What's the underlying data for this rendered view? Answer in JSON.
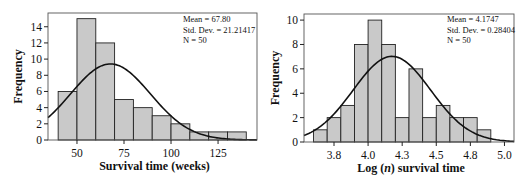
{
  "chart_data": [
    {
      "type": "bar",
      "subtype": "histogram_with_normal_curve",
      "xlabel": "Survival time (weeks)",
      "ylabel": "Frequency",
      "bin_edges": [
        40,
        50,
        60,
        70,
        80,
        90,
        100,
        110,
        120,
        130,
        140
      ],
      "values": [
        6,
        15,
        12,
        5,
        4,
        3,
        2,
        1,
        1,
        1
      ],
      "x_ticks": [
        50,
        75,
        100,
        125
      ],
      "x_tick_labels": [
        "50",
        "75",
        "100",
        "125"
      ],
      "y_ticks": [
        0,
        2,
        4,
        6,
        8,
        10,
        12,
        14
      ],
      "y_tick_labels": [
        "0",
        "2",
        "4",
        "6",
        "8",
        "10",
        "12",
        "14"
      ],
      "xlim": [
        34.6,
        145.7
      ],
      "ylim": [
        0,
        15.7
      ],
      "stats": {
        "mean_label": "Mean = 67.80",
        "sd_label": "Std. Dev. = 21.21417",
        "n_label": "N = 50"
      },
      "normal_curve": {
        "mean": 67.8,
        "sd": 21.21417,
        "n": 50,
        "bin_width": 10
      },
      "grid": false,
      "legend": "none"
    },
    {
      "type": "bar",
      "subtype": "histogram_with_normal_curve",
      "xlabel": "Log (n) survival time",
      "xlabel_parts": [
        "Log (",
        "n",
        ") survival time"
      ],
      "ylabel": "Frequency",
      "bin_edges": [
        3.6,
        3.7,
        3.8,
        3.9,
        4.0,
        4.1,
        4.2,
        4.3,
        4.4,
        4.5,
        4.6,
        4.7,
        4.8,
        4.9
      ],
      "values": [
        1,
        2,
        3,
        8,
        10,
        8,
        2,
        6,
        2,
        3,
        2,
        2,
        1
      ],
      "x_ticks": [
        3.75,
        4.0,
        4.25,
        4.5,
        4.75,
        5.0
      ],
      "x_tick_labels": [
        "3.8",
        "4.0",
        "4.3",
        "4.5",
        "4.8",
        "5.0"
      ],
      "y_ticks": [
        0,
        2,
        4,
        6,
        8,
        10
      ],
      "y_tick_labels": [
        "0",
        "2",
        "4",
        "6",
        "8",
        "10"
      ],
      "xlim": [
        3.53,
        5.07
      ],
      "ylim": [
        0,
        10.5
      ],
      "stats": {
        "mean_label": "Mean = 4.1747",
        "sd_label": "Std. Dev. = 0.28404",
        "n_label": "N = 50"
      },
      "normal_curve": {
        "mean": 4.1747,
        "sd": 0.28404,
        "n": 50,
        "bin_width": 0.1
      },
      "grid": false,
      "legend": "none"
    }
  ]
}
